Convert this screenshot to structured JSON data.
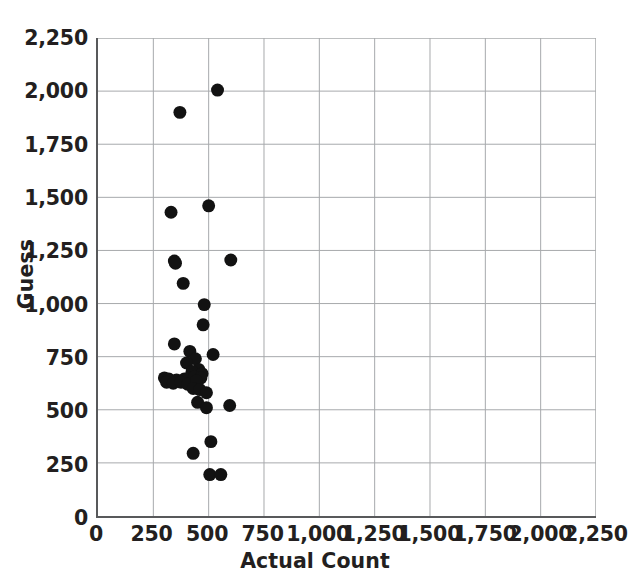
{
  "chart_data": {
    "type": "scatter",
    "title": "",
    "xlabel": "Actual Count",
    "ylabel": "Guess",
    "xlim": [
      0,
      2250
    ],
    "ylim": [
      0,
      2250
    ],
    "xticks": [
      0,
      250,
      500,
      750,
      1000,
      1250,
      1500,
      1750,
      2000,
      2250
    ],
    "yticks": [
      0,
      250,
      500,
      750,
      1000,
      1250,
      1500,
      1750,
      2000,
      2250
    ],
    "xtick_labels": [
      "0",
      "250",
      "500",
      "750",
      "1,000",
      "1,250",
      "1,500",
      "1,750",
      "2,000",
      "2,250"
    ],
    "ytick_labels": [
      "0",
      "250",
      "500",
      "750",
      "1,000",
      "1,250",
      "1,500",
      "1,750",
      "2,000",
      "2,250"
    ],
    "grid": true,
    "legend": false,
    "marker": "circle",
    "marker_color": "#121212",
    "marker_size": 13,
    "points": [
      {
        "x": 540,
        "y": 2005
      },
      {
        "x": 370,
        "y": 1900
      },
      {
        "x": 500,
        "y": 1460
      },
      {
        "x": 330,
        "y": 1430
      },
      {
        "x": 600,
        "y": 1205
      },
      {
        "x": 345,
        "y": 1200
      },
      {
        "x": 350,
        "y": 1190
      },
      {
        "x": 385,
        "y": 1095
      },
      {
        "x": 480,
        "y": 995
      },
      {
        "x": 475,
        "y": 900
      },
      {
        "x": 345,
        "y": 810
      },
      {
        "x": 415,
        "y": 775
      },
      {
        "x": 520,
        "y": 760
      },
      {
        "x": 440,
        "y": 740
      },
      {
        "x": 400,
        "y": 720
      },
      {
        "x": 455,
        "y": 690
      },
      {
        "x": 425,
        "y": 680
      },
      {
        "x": 470,
        "y": 670
      },
      {
        "x": 300,
        "y": 650
      },
      {
        "x": 320,
        "y": 645
      },
      {
        "x": 355,
        "y": 640
      },
      {
        "x": 390,
        "y": 645
      },
      {
        "x": 410,
        "y": 650
      },
      {
        "x": 435,
        "y": 655
      },
      {
        "x": 465,
        "y": 650
      },
      {
        "x": 310,
        "y": 630
      },
      {
        "x": 340,
        "y": 625
      },
      {
        "x": 375,
        "y": 630
      },
      {
        "x": 405,
        "y": 620
      },
      {
        "x": 445,
        "y": 635
      },
      {
        "x": 430,
        "y": 600
      },
      {
        "x": 460,
        "y": 595
      },
      {
        "x": 490,
        "y": 580
      },
      {
        "x": 450,
        "y": 535
      },
      {
        "x": 490,
        "y": 510
      },
      {
        "x": 595,
        "y": 520
      },
      {
        "x": 510,
        "y": 350
      },
      {
        "x": 430,
        "y": 295
      },
      {
        "x": 505,
        "y": 195
      },
      {
        "x": 555,
        "y": 195
      }
    ]
  }
}
